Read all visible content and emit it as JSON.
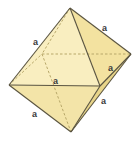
{
  "figure": {
    "shape": "octahedron",
    "colors": {
      "background": "#ffffff",
      "face_top_front": "#f9eec0",
      "face_top_right": "#f3e2a0",
      "face_bottom_front": "#f3e4a8",
      "face_bottom_right": "#e8d58a",
      "edge": "#5a5440",
      "hidden_edge": "#b8a86a",
      "label": "#3a3a3a"
    },
    "vertices": {
      "top": [
        70,
        8
      ],
      "bottom": [
        71,
        132
      ],
      "left": [
        9,
        85
      ],
      "front_right": [
        100,
        86
      ],
      "right": [
        131,
        54
      ],
      "back": [
        42,
        54
      ]
    },
    "labels": [
      {
        "text": "a",
        "x": 35,
        "y": 43,
        "edge": "top-left"
      },
      {
        "text": "a",
        "x": 104,
        "y": 30,
        "edge": "top-right"
      },
      {
        "text": "a",
        "x": 54,
        "y": 84,
        "edge": "left-front_right"
      },
      {
        "text": "a",
        "x": 110,
        "y": 70,
        "edge": "front_right-right"
      },
      {
        "text": "a",
        "x": 103,
        "y": 103,
        "edge": "front_right-bottom"
      },
      {
        "text": "a",
        "x": 33,
        "y": 116,
        "edge": "left-bottom"
      }
    ]
  }
}
